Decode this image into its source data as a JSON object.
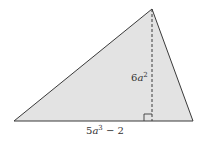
{
  "diagram": {
    "type": "triangle",
    "fill_color": "#e3e3e3",
    "stroke_color": "#3a3a3a",
    "vertices": {
      "left": [
        14,
        121
      ],
      "apex": [
        152,
        9
      ],
      "right": [
        193,
        121
      ]
    },
    "height_foot": [
      152,
      121
    ],
    "labels": {
      "height": {
        "coef": "6",
        "var": "a",
        "exp": "2"
      },
      "base": {
        "coef": "5",
        "var": "a",
        "exp": "3",
        "rest": " − 2"
      }
    },
    "right_angle_marker": true
  }
}
